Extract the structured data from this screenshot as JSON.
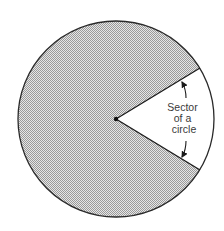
{
  "diagram": {
    "title": "Sector of a circle",
    "label_lines": [
      "Sector",
      "of a",
      "circle"
    ],
    "circle": {
      "cx": 116,
      "cy": 119,
      "r": 98
    },
    "sector": {
      "start_point": [
        200,
        68
      ],
      "end_point": [
        200,
        170
      ]
    },
    "colors": {
      "outline": "#2a2a2a",
      "fill_pattern": "#b0b0b0",
      "background": "#ffffff"
    }
  }
}
